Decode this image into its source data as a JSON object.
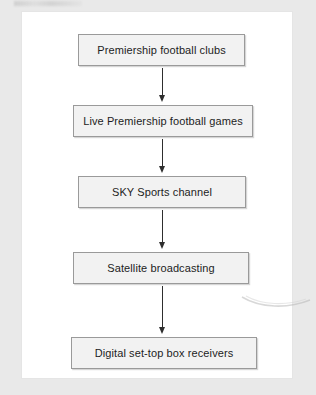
{
  "diagram": {
    "type": "flowchart",
    "orientation": "vertical-top-to-bottom",
    "nodes": [
      {
        "id": "n1",
        "label": "Premiership football clubs"
      },
      {
        "id": "n2",
        "label": "Live Premiership football games"
      },
      {
        "id": "n3",
        "label": "SKY Sports channel"
      },
      {
        "id": "n4",
        "label": "Satellite broadcasting"
      },
      {
        "id": "n5",
        "label": "Digital set-top box receivers"
      }
    ],
    "edges": [
      {
        "from": "n1",
        "to": "n2",
        "style": "arrow-down"
      },
      {
        "from": "n2",
        "to": "n3",
        "style": "arrow-down"
      },
      {
        "from": "n3",
        "to": "n4",
        "style": "arrow-down"
      },
      {
        "from": "n4",
        "to": "n5",
        "style": "arrow-down"
      }
    ],
    "colors": {
      "page_background": "#e9e9e9",
      "card_background": "#ffffff",
      "node_fill": "#f2f2f2",
      "node_border": "#9a9a9a",
      "text": "#1d1d1d",
      "arrow": "#2e2e2e"
    }
  }
}
